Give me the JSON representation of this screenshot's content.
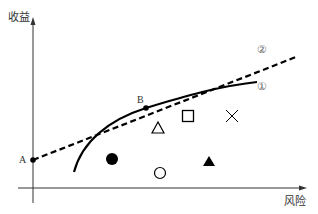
{
  "diagram": {
    "title": "",
    "axes": {
      "y_label": "收益",
      "x_label": "风险"
    },
    "points": {
      "A": {
        "label": "A",
        "x": 33,
        "y": 160
      },
      "B": {
        "label": "B",
        "x": 146,
        "y": 108
      }
    },
    "lines": [
      {
        "id": "line-2",
        "label": "②",
        "style": "dashed",
        "description": "Straight line from A through B (tangent line)"
      },
      {
        "id": "curve-1",
        "label": "①",
        "style": "solid",
        "description": "Concave curve tangent to line ② at B"
      }
    ],
    "markers": [
      {
        "shape": "triangle-open",
        "glyph": "△",
        "x": 158,
        "y": 128
      },
      {
        "shape": "square-open",
        "glyph": "□",
        "x": 188,
        "y": 116
      },
      {
        "shape": "cross",
        "glyph": "×",
        "x": 232,
        "y": 116
      },
      {
        "shape": "circle-filled",
        "glyph": "●",
        "x": 112,
        "y": 159
      },
      {
        "shape": "circle-open",
        "glyph": "○",
        "x": 160,
        "y": 173
      },
      {
        "shape": "triangle-filled",
        "glyph": "▲",
        "x": 209,
        "y": 162
      }
    ],
    "colors": {
      "stroke": "#000000",
      "text": "#333333",
      "circled_label": "#666666",
      "axis": "#333333"
    }
  }
}
